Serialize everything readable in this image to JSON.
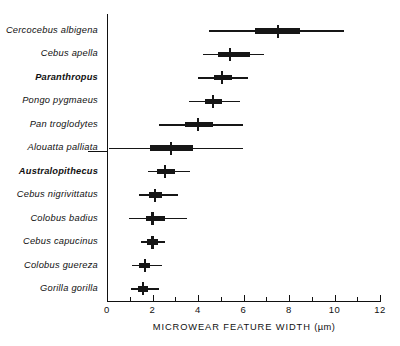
{
  "chart_data": {
    "type": "bar",
    "title": "",
    "subtitle": "",
    "xlabel": "MICROWEAR FEATURE WIDTH (µm)",
    "ylabel": "",
    "xlim": [
      0,
      12
    ],
    "xticks": [
      0,
      2,
      4,
      6,
      8,
      10,
      12
    ],
    "xtick_labels": [
      "0",
      "2",
      "4",
      "6",
      "8",
      "10",
      "12"
    ],
    "minor_xticks": [
      1,
      3,
      5,
      7,
      9,
      11
    ],
    "grid": false,
    "legend": null,
    "plot_style": "horizontal box-and-whisker (mean, standard deviation box, observed range)",
    "categories": [
      "Cercocebus albigena",
      "Cebus apella",
      "Paranthropus",
      "Pongo pygmaeus",
      "Pan troglodytes",
      "Alouatta palliata",
      "Australopithecus",
      "Cebus nigrivittatus",
      "Colobus badius",
      "Cebus capucinus",
      "Colobus guereza",
      "Gorilla gorilla"
    ],
    "series": [
      {
        "name": "Microwear feature width",
        "points": [
          {
            "label": "Cercocebus albigena",
            "mean": 7.5,
            "box_low": 6.5,
            "box_high": 8.5,
            "range_low": 4.5,
            "range_high": 10.4,
            "emphasis": false
          },
          {
            "label": "Cebus apella",
            "mean": 5.4,
            "box_low": 4.9,
            "box_high": 6.3,
            "range_low": 4.2,
            "range_high": 6.9,
            "emphasis": false
          },
          {
            "label": "Paranthropus",
            "mean": 5.05,
            "box_low": 4.7,
            "box_high": 5.5,
            "range_low": 4.0,
            "range_high": 6.2,
            "emphasis": true
          },
          {
            "label": "Pongo pygmaeus",
            "mean": 4.65,
            "box_low": 4.3,
            "box_high": 5.05,
            "range_low": 3.6,
            "range_high": 5.85,
            "emphasis": false
          },
          {
            "label": "Pan troglodytes",
            "mean": 4.0,
            "box_low": 3.45,
            "box_high": 4.65,
            "range_low": 2.3,
            "range_high": 6.0,
            "emphasis": false
          },
          {
            "label": "Alouatta palliata",
            "mean": 2.8,
            "box_low": 1.9,
            "box_high": 3.8,
            "range_low": 0.1,
            "range_high": 6.0,
            "emphasis": false
          },
          {
            "label": "Australopithecus",
            "mean": 2.55,
            "box_low": 2.2,
            "box_high": 3.0,
            "range_low": 1.8,
            "range_high": 3.65,
            "emphasis": true
          },
          {
            "label": "Cebus nigrivittatus",
            "mean": 2.1,
            "box_low": 1.85,
            "box_high": 2.4,
            "range_low": 1.4,
            "range_high": 3.1,
            "emphasis": false
          },
          {
            "label": "Colobus badius",
            "mean": 2.0,
            "box_low": 1.7,
            "box_high": 2.55,
            "range_low": 0.95,
            "range_high": 3.5,
            "emphasis": false
          },
          {
            "label": "Cebus capucinus",
            "mean": 2.0,
            "box_low": 1.75,
            "box_high": 2.25,
            "range_low": 1.5,
            "range_high": 2.55,
            "emphasis": false
          },
          {
            "label": "Colobus guereza",
            "mean": 1.67,
            "box_low": 1.4,
            "box_high": 1.9,
            "range_low": 1.1,
            "range_high": 2.4,
            "emphasis": false
          },
          {
            "label": "Gorilla gorilla",
            "mean": 1.58,
            "box_low": 1.35,
            "box_high": 1.8,
            "range_low": 1.05,
            "range_high": 2.3,
            "emphasis": false
          }
        ]
      }
    ],
    "annotations": [
      {
        "name": "group-separator",
        "description": "short horizontal rule left of axis between Alouatta palliata and Australopithecus rows"
      }
    ],
    "colors": {
      "ink": "#161616",
      "axis": "#111111",
      "background": "#ffffff"
    }
  },
  "axis": {
    "x_title_main": "MICROWEAR FEATURE WIDTH",
    "x_title_unit": "(µm)"
  }
}
